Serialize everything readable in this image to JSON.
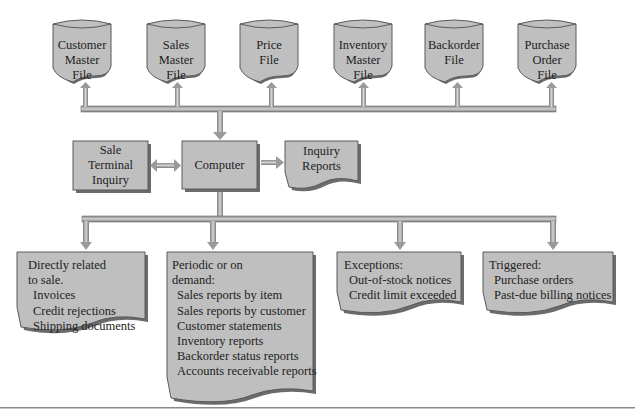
{
  "colors": {
    "shape_fill": "#bfbfbf",
    "shape_stroke": "#5a5a5a",
    "shadow": "#6b6b6b",
    "connector": "#9a9a9a",
    "background": "#ffffff"
  },
  "files": [
    {
      "name": "customer-master-file",
      "lines": [
        "Customer",
        "Master",
        "File"
      ]
    },
    {
      "name": "sales-master-file",
      "lines": [
        "Sales",
        "Master",
        "File"
      ]
    },
    {
      "name": "price-file",
      "lines": [
        "Price",
        "File"
      ]
    },
    {
      "name": "inventory-master-file",
      "lines": [
        "Inventory",
        "Master",
        "File"
      ]
    },
    {
      "name": "backorder-file",
      "lines": [
        "Backorder",
        "File"
      ]
    },
    {
      "name": "purchase-order-file",
      "lines": [
        "Purchase",
        "Order",
        "File"
      ]
    }
  ],
  "processing": {
    "terminal": {
      "lines": [
        "Sale",
        "Terminal",
        "Inquiry"
      ]
    },
    "computer": {
      "label": "Computer"
    },
    "inquiry_reports": {
      "lines": [
        "Inquiry",
        "Reports"
      ]
    }
  },
  "outputs": [
    {
      "name": "directly-related",
      "heading": [
        "Directly related",
        "to sale."
      ],
      "items": [
        "Invoices",
        "Credit rejections",
        "Shipping documents"
      ]
    },
    {
      "name": "periodic-or-on-demand",
      "heading": [
        "Periodic or on",
        "demand:"
      ],
      "items": [
        "Sales reports by item",
        "Sales reports by customer",
        "Customer statements",
        "Inventory reports",
        "Backorder status reports",
        "Accounts receivable reports"
      ]
    },
    {
      "name": "exceptions",
      "heading": [
        "Exceptions:"
      ],
      "items": [
        "Out-of-stock notices",
        "Credit limit exceeded"
      ]
    },
    {
      "name": "triggered",
      "heading": [
        "Triggered:"
      ],
      "items": [
        "Purchase orders",
        "Past-due billing notices"
      ]
    }
  ]
}
